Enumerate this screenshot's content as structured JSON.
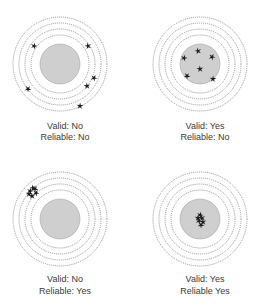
{
  "colors": {
    "ring": "#6a6a6a",
    "bullseye_fill": "#cfcfcf",
    "hit": "#1e1e1e",
    "text": "#3a3a3a"
  },
  "panels": [
    {
      "id": "not-valid-not-reliable",
      "valid_label": "Valid: No",
      "reliable_label": "Reliable: No",
      "hits": [
        [
          -26,
          -18
        ],
        [
          28,
          -18
        ],
        [
          34,
          14
        ],
        [
          27,
          22
        ],
        [
          -32,
          25
        ],
        [
          20,
          42
        ]
      ]
    },
    {
      "id": "valid-not-reliable",
      "valid_label": "Valid: Yes",
      "reliable_label": "Reliable: No",
      "hits": [
        [
          -16,
          -6
        ],
        [
          -2,
          -13
        ],
        [
          12,
          -7
        ],
        [
          0,
          5
        ],
        [
          -13,
          12
        ],
        [
          13,
          15
        ]
      ]
    },
    {
      "id": "not-valid-reliable",
      "valid_label": "Valid: No",
      "reliable_label": "Reliable: Yes",
      "hits": [
        [
          -30,
          -28
        ],
        [
          -27,
          -31
        ],
        [
          -24,
          -26
        ],
        [
          -28,
          -23
        ],
        [
          -25,
          -30
        ],
        [
          -31,
          -25
        ]
      ]
    },
    {
      "id": "valid-reliable",
      "valid_label": "Valid: Yes",
      "reliable_label": "Reliable Yes",
      "hits": [
        [
          0,
          -4
        ],
        [
          2,
          -1
        ],
        [
          -1,
          2
        ],
        [
          3,
          3
        ],
        [
          1,
          6
        ],
        [
          -2,
          -1
        ]
      ]
    }
  ]
}
